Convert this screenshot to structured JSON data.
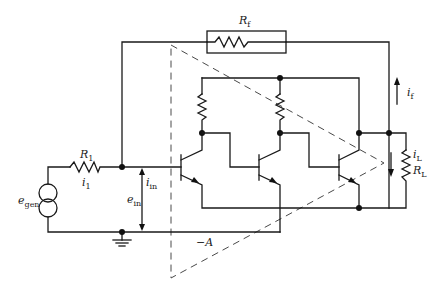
{
  "diagram": {
    "colors": {
      "wire": "#1a1a1a",
      "dashed": "#4a4a4a",
      "background": "#ffffff"
    },
    "components": {
      "feedback_resistor": {
        "symbol": "R",
        "sub": "f"
      },
      "input_resistor": {
        "symbol": "R",
        "sub": "1"
      },
      "load_resistor": {
        "symbol": "R",
        "sub": "L"
      },
      "source": {
        "symbol": "e",
        "sub": "gen"
      },
      "amplifier_gain": "−A"
    },
    "labels": {
      "i1": {
        "symbol": "i",
        "sub": "1"
      },
      "iin": {
        "symbol": "i",
        "sub": "in"
      },
      "ein": {
        "symbol": "e",
        "sub": "in"
      },
      "if": {
        "symbol": "i",
        "sub": "f"
      },
      "iL": {
        "symbol": "i",
        "sub": "L"
      }
    },
    "transistors": [
      "Q1",
      "Q2",
      "Q3"
    ],
    "icons": [
      "current-source-icon",
      "ground-icon",
      "npn-transistor-icon",
      "resistor-icon",
      "arrow-icon"
    ]
  }
}
